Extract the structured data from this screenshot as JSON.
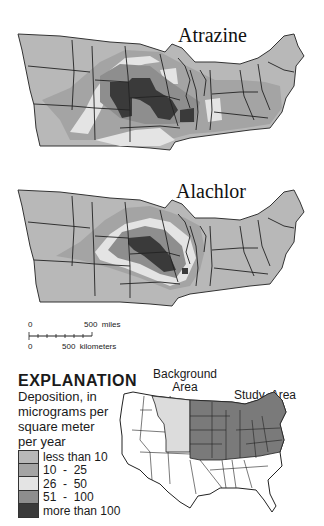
{
  "maps": [
    {
      "title": "Atrazine"
    },
    {
      "title": "Alachlor"
    }
  ],
  "scale_bar": {
    "miles_zero": "0",
    "miles_label": "500  miles",
    "km_zero": "0",
    "km_label": "500  kilometers"
  },
  "legend": {
    "title": "EXPLANATION",
    "subtitle_lines": [
      "Deposition, in",
      "micrograms per",
      "square meter",
      "per year"
    ],
    "items": [
      {
        "label": "less than 10",
        "color": "#b8b8b8"
      },
      {
        "label": "10  -  25",
        "color": "#a4a4a4"
      },
      {
        "label": "26  -  50",
        "color": "#e4e4e4"
      },
      {
        "label": "51  -  100",
        "color": "#8e8e8e"
      },
      {
        "label": "more than 100",
        "color": "#3a3a3a"
      }
    ]
  },
  "inset_map": {
    "background_label_line1": "Background",
    "background_label_line2": "Area",
    "study_label": "Study  Area",
    "background_color": "#dcdcdc",
    "study_color": "#7a7a7a"
  }
}
